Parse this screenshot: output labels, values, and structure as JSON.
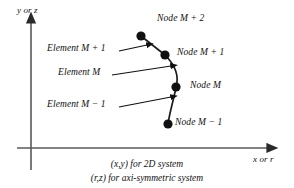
{
  "figure": {
    "type": "technical-diagram"
  },
  "axes": {
    "vertical_label": "y or z",
    "horizontal_label": "x or r",
    "origin": {
      "x": 31,
      "y": 148
    }
  },
  "nodes": [
    {
      "id": "node-m-plus-2",
      "label": "Node M + 2",
      "x": 141,
      "y": 36,
      "label_x": 157,
      "label_y": 17
    },
    {
      "id": "node-m-plus-1",
      "label": "Node M + 1",
      "x": 165,
      "y": 55,
      "label_x": 176,
      "label_y": 50
    },
    {
      "id": "node-m",
      "label": "Node M",
      "x": 176,
      "y": 87,
      "label_x": 190,
      "label_y": 82
    },
    {
      "id": "node-m-minus-1",
      "label": "Node M − 1",
      "x": 168,
      "y": 124,
      "label_x": 176,
      "label_y": 119
    }
  ],
  "elements": [
    {
      "id": "element-m-plus-1",
      "label": "Element M + 1",
      "label_x": 55,
      "label_y": 47,
      "arrow_from_x": 119,
      "arrow_from_y": 51,
      "arrow_to_x": 148,
      "arrow_to_y": 45
    },
    {
      "id": "element-m",
      "label": "Element M",
      "label_x": 65,
      "label_y": 71,
      "arrow_from_x": 112,
      "arrow_from_y": 75,
      "arrow_to_x": 172,
      "arrow_to_y": 66
    },
    {
      "id": "element-m-minus-1",
      "label": "Element M − 1",
      "label_x": 55,
      "label_y": 103,
      "arrow_from_x": 119,
      "arrow_from_y": 107,
      "arrow_to_x": 172,
      "arrow_to_y": 97
    }
  ],
  "caption": {
    "line1": "(x,y) for 2D system",
    "line2": "(r,z) for axi-symmetric system"
  },
  "colors": {
    "stroke": "#2a2a2a",
    "node_fill": "#111111",
    "background": "#ffffff",
    "text": "#111111"
  }
}
